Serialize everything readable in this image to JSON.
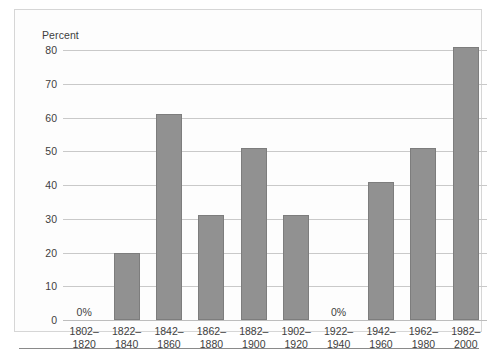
{
  "chart_data": {
    "type": "bar",
    "title": "",
    "subtitle": "",
    "xlabel": "",
    "ylabel": "Percent",
    "ylim": [
      0,
      80
    ],
    "yticks": [
      0,
      10,
      20,
      30,
      40,
      50,
      60,
      70,
      80
    ],
    "ytick_labels": [
      "0",
      "10",
      "20",
      "30",
      "40",
      "50",
      "60",
      "70",
      "80"
    ],
    "grid": true,
    "legend": "none",
    "categories": [
      "1802–\n1820",
      "1822–\n1840",
      "1842–\n1860",
      "1862–\n1880",
      "1882–\n1900",
      "1902–\n1920",
      "1922–\n1940",
      "1942–\n1960",
      "1962–\n1980",
      "1982–\n2000"
    ],
    "category_lines": [
      [
        "1802–",
        "1820"
      ],
      [
        "1822–",
        "1840"
      ],
      [
        "1842–",
        "1860"
      ],
      [
        "1862–",
        "1880"
      ],
      [
        "1882–",
        "1900"
      ],
      [
        "1902–",
        "1920"
      ],
      [
        "1922–",
        "1940"
      ],
      [
        "1942–",
        "1960"
      ],
      [
        "1962–",
        "1980"
      ],
      [
        "1982–",
        "2000"
      ]
    ],
    "values": [
      0,
      20,
      61,
      31,
      51,
      31,
      0,
      41,
      51,
      81
    ],
    "data_labels": [
      "0%",
      "",
      "",
      "",
      "",
      "",
      "0%",
      "",
      "",
      ""
    ],
    "bar_color": "#919191",
    "bar_edge_color": "#7d7d7d",
    "grid_color": "#c9c9c9",
    "text_color": "#3e3e3e",
    "background": "#fdfdfd"
  }
}
